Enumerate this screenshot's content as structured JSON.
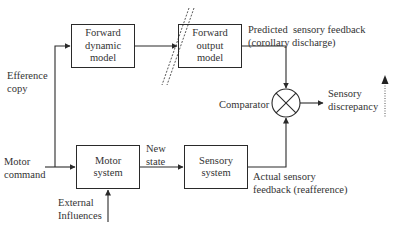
{
  "diagram": {
    "type": "block-diagram",
    "blocks": {
      "forward_dynamic_model": {
        "line1": "Forward",
        "line2": "dynamic",
        "line3": "model"
      },
      "forward_output_model": {
        "line1": "Forward",
        "line2": "output",
        "line3": "model"
      },
      "motor_system": {
        "line1": "Motor",
        "line2": "system"
      },
      "sensory_system": {
        "line1": "Sensory",
        "line2": "system"
      }
    },
    "labels": {
      "efference_copy": {
        "line1": "Efference",
        "line2": "copy"
      },
      "motor_command": {
        "line1": "Motor",
        "line2": "command"
      },
      "new_state": {
        "line1": "New",
        "line2": "state"
      },
      "external_influences": {
        "line1": "External",
        "line2": "Influences"
      },
      "predicted_feedback": {
        "line1": "Predicted  sensory feedback",
        "line2": "(corollary discharge)"
      },
      "actual_feedback": {
        "line1": "Actual sensory",
        "line2": "feedback (reafference)"
      },
      "comparator": "Comparator",
      "sensory_discrepancy": {
        "line1": "Sensory",
        "line2": "discrepancy"
      }
    },
    "edges": [
      {
        "from": "Motor command",
        "to": "Motor system"
      },
      {
        "from": "Motor command",
        "to": "Forward dynamic model",
        "label": "Efference copy"
      },
      {
        "from": "Forward dynamic model",
        "to": "Forward output model"
      },
      {
        "from": "Forward output model",
        "to": "Comparator",
        "label": "Predicted sensory feedback (corollary discharge)"
      },
      {
        "from": "Motor system",
        "to": "Sensory system",
        "label": "New state"
      },
      {
        "from": "External Influences",
        "to": "Motor system"
      },
      {
        "from": "Sensory system",
        "to": "Comparator",
        "label": "Actual sensory feedback (reafference)"
      },
      {
        "from": "Comparator",
        "to": "Sensory discrepancy"
      }
    ],
    "colors": {
      "stroke": "#2a2a2a",
      "text": "#333333",
      "background": "#ffffff"
    }
  }
}
